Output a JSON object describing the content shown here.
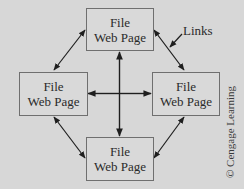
{
  "diagram": {
    "type": "network",
    "nodes": [
      {
        "id": "top",
        "line1": "File",
        "line2": "Web Page"
      },
      {
        "id": "left",
        "line1": "File",
        "line2": "Web Page"
      },
      {
        "id": "right",
        "line1": "File",
        "line2": "Web Page"
      },
      {
        "id": "bottom",
        "line1": "File",
        "line2": "Web Page"
      }
    ],
    "edges": [
      {
        "from": "top",
        "to": "left",
        "type": "bidirectional"
      },
      {
        "from": "top",
        "to": "right",
        "type": "bidirectional"
      },
      {
        "from": "left",
        "to": "bottom",
        "type": "bidirectional"
      },
      {
        "from": "right",
        "to": "bottom",
        "type": "bidirectional"
      },
      {
        "from": "center",
        "to": "top",
        "type": "directed"
      },
      {
        "from": "center",
        "to": "left",
        "type": "directed"
      },
      {
        "from": "center",
        "to": "right",
        "type": "directed"
      },
      {
        "from": "center",
        "to": "bottom",
        "type": "directed"
      }
    ],
    "annotation": "Links",
    "credit": "© Cengage Learning"
  },
  "colors": {
    "background": "#d7d7d7",
    "box_border": "#6f6f6f",
    "arrow": "#1e1e1e"
  }
}
